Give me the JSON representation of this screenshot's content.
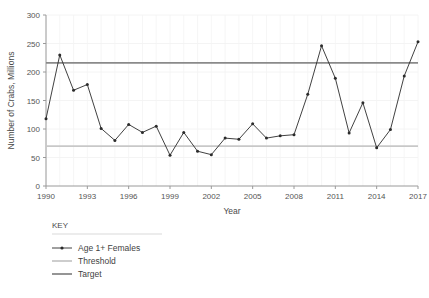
{
  "chart_data": {
    "type": "line",
    "title": "",
    "xlabel": "Year",
    "ylabel": "Number of Crabs, Millions",
    "xlim": [
      1990,
      2017
    ],
    "ylim": [
      0,
      300
    ],
    "yticks": [
      0,
      50,
      100,
      150,
      200,
      250,
      300
    ],
    "xticks": [
      1990,
      1993,
      1996,
      1999,
      2002,
      2005,
      2008,
      2011,
      2014,
      2017
    ],
    "grid": "faint-vertical-and-horizontal",
    "legend_position": "below-plot-left",
    "x": [
      1990,
      1991,
      1992,
      1993,
      1994,
      1995,
      1996,
      1997,
      1998,
      1999,
      2000,
      2001,
      2002,
      2003,
      2004,
      2005,
      2006,
      2007,
      2008,
      2009,
      2010,
      2011,
      2012,
      2013,
      2014,
      2015,
      2016,
      2017
    ],
    "series": [
      {
        "name": "Age 1+ Females",
        "type": "line-with-markers",
        "color": "#2b2b2b",
        "values": [
          118,
          230,
          168,
          178,
          101,
          80,
          108,
          94,
          105,
          54,
          94,
          61,
          55,
          84,
          82,
          109,
          84,
          88,
          90,
          161,
          246,
          189,
          93,
          146,
          67,
          99,
          193,
          253
        ]
      },
      {
        "name": "Threshold",
        "type": "horizontal-line",
        "color": "#c8c8c8",
        "value": 70
      },
      {
        "name": "Target",
        "type": "horizontal-line",
        "color": "#8a8a8a",
        "value": 216
      }
    ],
    "legend": {
      "title": "KEY",
      "entries": [
        {
          "label": "Age 1+ Females",
          "style": "line-marker",
          "color": "#2b2b2b"
        },
        {
          "label": "Threshold",
          "style": "line",
          "color": "#c8c8c8"
        },
        {
          "label": "Target",
          "style": "line",
          "color": "#8a8a8a"
        }
      ]
    }
  }
}
